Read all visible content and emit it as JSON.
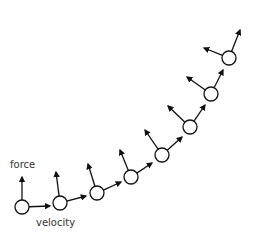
{
  "diagram": {
    "labels": {
      "force": "force",
      "velocity": "velocity"
    },
    "colors": {
      "stroke": "#111111",
      "fill": "#ffffff",
      "text": "#333333"
    },
    "nodes": [
      {
        "x": 22,
        "y": 207,
        "force_tip": [
          22,
          177
        ],
        "vel_tip": [
          50,
          206
        ]
      },
      {
        "x": 60,
        "y": 203,
        "force_tip": [
          56,
          172
        ],
        "vel_tip": [
          86,
          196
        ]
      },
      {
        "x": 97,
        "y": 193,
        "force_tip": [
          88,
          164
        ],
        "vel_tip": [
          121,
          182
        ]
      },
      {
        "x": 131,
        "y": 177,
        "force_tip": [
          120,
          150
        ],
        "vel_tip": [
          152,
          163
        ]
      },
      {
        "x": 162,
        "y": 155,
        "force_tip": [
          145,
          130
        ],
        "vel_tip": [
          182,
          137
        ]
      },
      {
        "x": 190,
        "y": 127,
        "force_tip": [
          168,
          106
        ],
        "vel_tip": [
          205,
          105
        ]
      },
      {
        "x": 211,
        "y": 94,
        "force_tip": [
          187,
          77
        ],
        "vel_tip": [
          223,
          70
        ]
      },
      {
        "x": 229,
        "y": 58,
        "force_tip": [
          204,
          48
        ],
        "vel_tip": [
          240,
          30
        ]
      }
    ]
  }
}
